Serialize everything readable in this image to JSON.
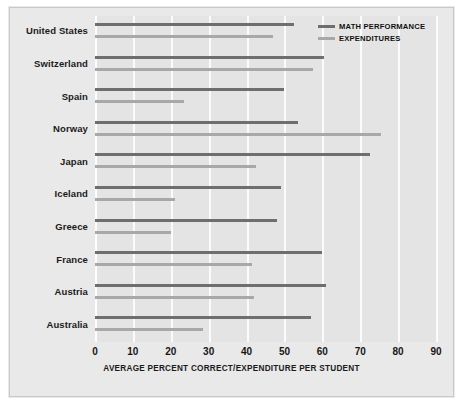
{
  "chart_data": {
    "type": "bar",
    "orientation": "horizontal",
    "title": "",
    "xlabel": "AVERAGE PERCENT CORRECT/EXPENDITURE PER STUDENT",
    "ylabel": "",
    "xlim": [
      0,
      90
    ],
    "grid": true,
    "legend_position": "top-right",
    "xticks": [
      "0",
      "10",
      "20",
      "30",
      "40",
      "50",
      "60",
      "70",
      "80",
      "90"
    ],
    "categories": [
      "United States",
      "Switzerland",
      "Spain",
      "Norway",
      "Japan",
      "Iceland",
      "Greece",
      "France",
      "Austria",
      "Australia"
    ],
    "series": [
      {
        "name": "MATH PERFORMANCE",
        "color": "#6e6e6e",
        "values": [
          52.5,
          60.5,
          50,
          53.5,
          72.5,
          49,
          48,
          60,
          61,
          57
        ]
      },
      {
        "name": "EXPENDITURES",
        "color": "#a8a8a8",
        "values": [
          47,
          57.5,
          23.5,
          75.5,
          42.5,
          21,
          20,
          41.5,
          42,
          28.5
        ]
      }
    ]
  },
  "legend": {
    "items": [
      {
        "label": "MATH PERFORMANCE",
        "color": "#6e6e6e"
      },
      {
        "label": "EXPENDITURES",
        "color": "#a8a8a8"
      }
    ]
  },
  "colors": {
    "page_background": "#ffffff",
    "plate_background": "#e9e9e9",
    "plot_background": "#e4e4e4",
    "gridline": "#fbfbfb",
    "math_performance": "#6e6e6e",
    "expenditures": "#a8a8a8",
    "text": "#1b1b1b"
  }
}
